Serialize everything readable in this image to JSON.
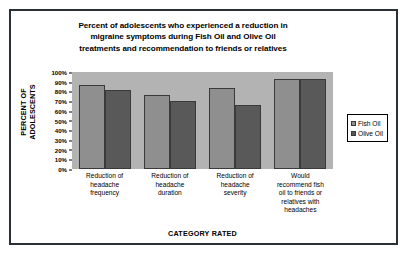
{
  "chart_data": {
    "type": "bar",
    "title": "Percent of adolescents who experienced a reduction in migraine symptoms during Fish Oil and Olive Oil treatments and recommendation to friends or relatives",
    "title_lines": [
      "Percent of adolescents who experienced a reduction in",
      "migraine symptoms during Fish Oil and Olive Oil",
      "treatments and recommendation to friends or relatives"
    ],
    "xlabel": "CATEGORY RATED",
    "ylabel": "PERCENT OF ADOLESCENTS",
    "categories": [
      "Reduction of headache frequency",
      "Reduction of headache duration",
      "Reduction of headache severity",
      "Would recommend fish oil to friends or relatives with headaches"
    ],
    "category_lines": [
      [
        "Reduction of",
        "headache",
        "frequency"
      ],
      [
        "Reduction of",
        "headache",
        "duration"
      ],
      [
        "Reduction of",
        "headache",
        "severity"
      ],
      [
        "Would",
        "recommend fish",
        "oil to friends or",
        "relatives with",
        "headaches"
      ]
    ],
    "series": [
      {
        "name": "Fish Oil",
        "color": "#8f8f8f",
        "values": [
          87,
          76,
          84,
          93
        ]
      },
      {
        "name": "Olive Oil",
        "color": "#595959",
        "values": [
          81,
          70,
          66,
          93
        ]
      }
    ],
    "ylim": [
      0,
      100
    ],
    "yticks": [
      100,
      90,
      80,
      70,
      60,
      50,
      40,
      30,
      20,
      10,
      0
    ],
    "yticklabels": [
      "100%",
      "90%",
      "80%",
      "70%",
      "60%",
      "50%",
      "40%",
      "30%",
      "20%",
      "10%",
      "0%"
    ],
    "grid": false,
    "legend_position": "right",
    "legend_entries": [
      "Fish Oil",
      "Olive Oil"
    ],
    "plot_background_color": "#b3b3b3",
    "figure_background_color": "#ffffff",
    "figure_border_color": "#2b2f38"
  }
}
